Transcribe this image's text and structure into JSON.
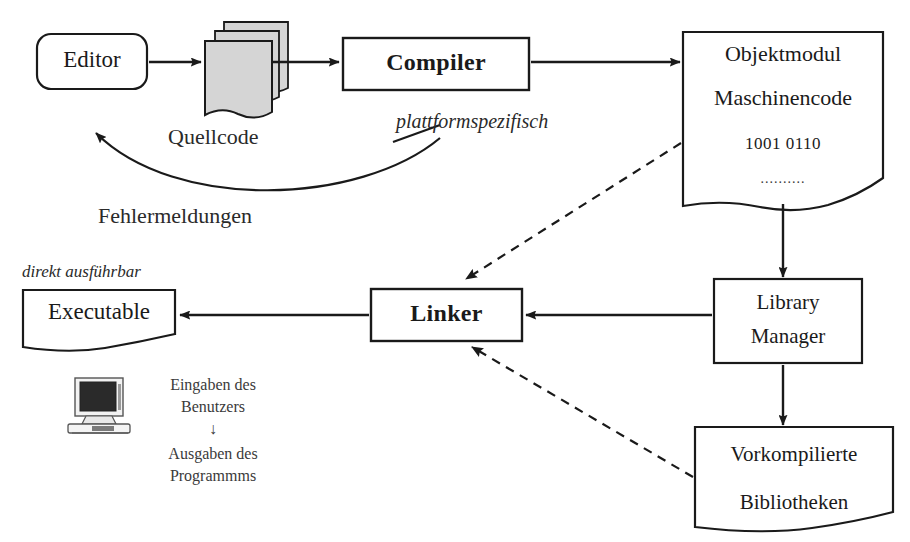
{
  "diagram": {
    "background": "#ffffff",
    "stroke": "#1a1a1a",
    "fill_document": "#ffffff",
    "fill_sourcecode": "#d8d8d8",
    "nodes": {
      "editor": {
        "label": "Editor",
        "shape": "rounded-rect"
      },
      "quellcode": {
        "label": "Quellcode",
        "shape": "document-stack"
      },
      "compiler": {
        "label": "Compiler",
        "shape": "rect",
        "bold": true
      },
      "objektmodul": {
        "line1": "Objektmodul",
        "line2": "Maschinencode",
        "line3": "1001 0110",
        "line4": "..........",
        "shape": "document"
      },
      "linker": {
        "label": "Linker",
        "shape": "rect",
        "bold": true
      },
      "executable": {
        "label": "Executable",
        "shape": "document"
      },
      "library_manager": {
        "line1": "Library",
        "line2": "Manager",
        "shape": "rect"
      },
      "bibliotheken": {
        "line1": "Vorkompilierte",
        "line2": "Bibliotheken",
        "shape": "document"
      }
    },
    "edge_labels": {
      "fehlermeldungen": "Fehlermeldungen",
      "plattformspezifisch": "plattformspezifisch",
      "direkt_ausfuehrbar": "direkt ausführbar"
    },
    "io_block": {
      "line1": "Eingaben des",
      "line2": "Benutzers",
      "arrow": "↓",
      "line3": "Ausgaben des",
      "line4": "Programmms",
      "icon": "computer-icon"
    }
  }
}
